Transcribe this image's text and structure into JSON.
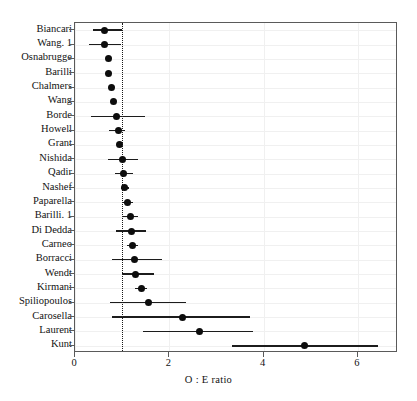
{
  "chart_data": {
    "type": "scatter",
    "subtype": "forest-plot",
    "title": "",
    "xlabel": "O : E ratio",
    "ylabel": "",
    "xlim": [
      0,
      6.85
    ],
    "xticks": [
      0,
      2,
      4,
      6
    ],
    "xticklabels": [
      "0",
      "2",
      "4",
      "6"
    ],
    "grid": true,
    "legend": null,
    "reference_line": {
      "value": 1,
      "style": "dotted"
    },
    "categories": [
      "Biancari",
      "Wang. 1",
      "Osnabrugge",
      "Barilli",
      "Chalmers",
      "Wang",
      "Borde",
      "Howell",
      "Grant",
      "Nishida",
      "Qadir",
      "Nashef",
      "Paparella",
      "Barilli. 1",
      "Di Dedda",
      "Carneo",
      "Borracci",
      "Wendt",
      "Kirmani",
      "Spiliopoulos",
      "Carosella",
      "Laurent",
      "Kunt"
    ],
    "points": [
      {
        "study": "Biancari",
        "estimate": 0.62,
        "lower": 0.38,
        "upper": 0.99
      },
      {
        "study": "Wang. 1",
        "estimate": 0.62,
        "lower": 0.3,
        "upper": 0.98
      },
      {
        "study": "Osnabrugge",
        "estimate": 0.7,
        "lower": 0.66,
        "upper": 0.75
      },
      {
        "study": "Barilli",
        "estimate": 0.71,
        "lower": 0.66,
        "upper": 0.77
      },
      {
        "study": "Chalmers",
        "estimate": 0.77,
        "lower": 0.72,
        "upper": 0.83
      },
      {
        "study": "Wang",
        "estimate": 0.82,
        "lower": 0.76,
        "upper": 0.88
      },
      {
        "study": "Borde",
        "estimate": 0.88,
        "lower": 0.33,
        "upper": 1.48
      },
      {
        "study": "Howell",
        "estimate": 0.93,
        "lower": 0.73,
        "upper": 1.07
      },
      {
        "study": "Grant",
        "estimate": 0.95,
        "lower": 0.91,
        "upper": 1.0
      },
      {
        "study": "Nishida",
        "estimate": 1.0,
        "lower": 0.7,
        "upper": 1.33
      },
      {
        "study": "Qadir",
        "estimate": 1.03,
        "lower": 0.85,
        "upper": 1.22
      },
      {
        "study": "Nashef",
        "estimate": 1.05,
        "lower": 0.98,
        "upper": 1.14
      },
      {
        "study": "Paparella",
        "estimate": 1.11,
        "lower": 1.0,
        "upper": 1.22
      },
      {
        "study": "Barilli. 1",
        "estimate": 1.17,
        "lower": 1.02,
        "upper": 1.33
      },
      {
        "study": "Di Dedda",
        "estimate": 1.19,
        "lower": 0.87,
        "upper": 1.51
      },
      {
        "study": "Carneo",
        "estimate": 1.22,
        "lower": 1.11,
        "upper": 1.34
      },
      {
        "study": "Borracci",
        "estimate": 1.27,
        "lower": 0.78,
        "upper": 1.85
      },
      {
        "study": "Wendt",
        "estimate": 1.28,
        "lower": 0.99,
        "upper": 1.68
      },
      {
        "study": "Kirmani",
        "estimate": 1.41,
        "lower": 1.27,
        "upper": 1.52
      },
      {
        "study": "Spiliopoulos",
        "estimate": 1.55,
        "lower": 0.75,
        "upper": 2.35
      },
      {
        "study": "Carosella",
        "estimate": 2.27,
        "lower": 0.78,
        "upper": 3.72
      },
      {
        "study": "Laurent",
        "estimate": 2.63,
        "lower": 1.45,
        "upper": 3.78
      },
      {
        "study": "Kunt",
        "estimate": 4.87,
        "lower": 3.32,
        "upper": 6.42
      }
    ]
  },
  "colors": {
    "point": "#0d0d0d",
    "line": "#1c1c1c",
    "frame": "#5a5a5a",
    "grid": "#f0f0f0",
    "reference": "#1a1a1a",
    "background": "#ffffff"
  }
}
